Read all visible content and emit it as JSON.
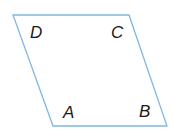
{
  "figure": {
    "shape": "parallelogram",
    "stroke_color": "#7fb8e0",
    "vertices": {
      "A": {
        "x": 53,
        "y": 126
      },
      "B": {
        "x": 167,
        "y": 126
      },
      "C": {
        "x": 129,
        "y": 15
      },
      "D": {
        "x": 13,
        "y": 15
      }
    },
    "labels": {
      "A": "A",
      "B": "B",
      "C": "C",
      "D": "D"
    }
  }
}
